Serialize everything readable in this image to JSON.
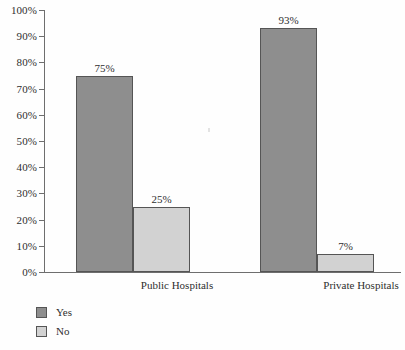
{
  "chart_data": {
    "type": "bar",
    "title": "",
    "subtitle": "",
    "xlabel": "",
    "ylabel": "",
    "categories": [
      "Public Hospitals",
      "Private Hospitals"
    ],
    "series": [
      {
        "name": "Yes",
        "color": "#8e8e8e",
        "values": [
          75,
          93
        ],
        "labels": [
          "75%",
          "7%"
        ]
      },
      {
        "name": "No",
        "color": "#d2d2d2",
        "values": [
          25,
          7
        ],
        "labels": [
          "25%",
          "7%"
        ]
      }
    ],
    "bars": [
      {
        "category": "Public Hospitals",
        "series": "Yes",
        "value": 75,
        "label": "75%"
      },
      {
        "category": "Public Hospitals",
        "series": "No",
        "value": 25,
        "label": "25%"
      },
      {
        "category": "Private Hospitals",
        "series": "Yes",
        "value": 93,
        "label": "93%"
      },
      {
        "category": "Private Hospitals",
        "series": "No",
        "value": 7,
        "label": "7%"
      }
    ],
    "ylim": [
      0,
      100
    ],
    "ytick_step": 10,
    "ytick_labels": [
      "100%",
      "90%",
      "80%",
      "70%",
      "60%",
      "50%",
      "40%",
      "30%",
      "20%",
      "10%",
      "0%"
    ],
    "ytick_values": [
      100,
      90,
      80,
      70,
      60,
      50,
      40,
      30,
      20,
      10,
      0
    ],
    "grid": false,
    "legend_position": "bottom-left",
    "legend": [
      {
        "label": "Yes",
        "color": "#8e8e8e"
      },
      {
        "label": "No",
        "color": "#d2d2d2"
      }
    ]
  },
  "axis": {
    "y_ticks": [
      {
        "label": "100%",
        "value": 100
      },
      {
        "label": "90%",
        "value": 90
      },
      {
        "label": "80%",
        "value": 80
      },
      {
        "label": "70%",
        "value": 70
      },
      {
        "label": "60%",
        "value": 60
      },
      {
        "label": "50%",
        "value": 50
      },
      {
        "label": "40%",
        "value": 40
      },
      {
        "label": "30%",
        "value": 30
      },
      {
        "label": "20%",
        "value": 20
      },
      {
        "label": "10%",
        "value": 10
      },
      {
        "label": "0%",
        "value": 0
      }
    ],
    "x_categories": [
      {
        "label": "Public Hospitals"
      },
      {
        "label": "Private Hospitals"
      }
    ]
  },
  "bars_render": [
    {
      "name": "bar-public-yes",
      "label": "75%",
      "value": 75,
      "series": "yes",
      "left": 32,
      "width": 57
    },
    {
      "name": "bar-public-no",
      "label": "25%",
      "value": 25,
      "series": "no",
      "left": 89,
      "width": 57
    },
    {
      "name": "bar-private-yes",
      "label": "93%",
      "value": 93,
      "series": "yes",
      "left": 216,
      "width": 57
    },
    {
      "name": "bar-private-no",
      "label": "7%",
      "value": 7,
      "series": "no",
      "left": 273,
      "width": 57
    }
  ],
  "category_positions": [
    {
      "label": "Public Hospitals",
      "center": 133
    },
    {
      "label": "Private Hospitals",
      "center": 317
    }
  ]
}
